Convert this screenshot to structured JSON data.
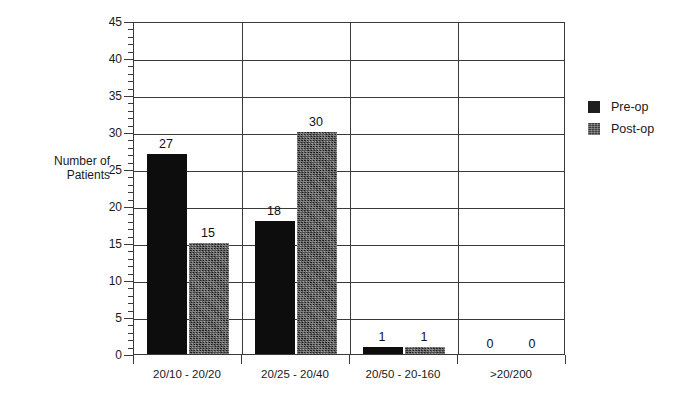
{
  "chart_data": {
    "type": "bar",
    "title": "",
    "xlabel": "",
    "ylabel": "Number of Patients",
    "ylabel_lines": [
      "Number of",
      "Patients"
    ],
    "ylim": [
      0,
      45
    ],
    "ytick_step": 5,
    "yminor_step": 1,
    "grid": "horizontal-and-category-separators",
    "legend_position": "right",
    "categories": [
      "20/10 - 20/20",
      "20/25 - 20/40",
      "20/50 - 20-160",
      ">20/200"
    ],
    "ytick_labels": [
      "0",
      "5",
      "10",
      "15",
      "20",
      "25",
      "30",
      "35",
      "40",
      "45"
    ],
    "series": [
      {
        "name": "Pre-op",
        "color": "#0d0d0d",
        "values": [
          27,
          18,
          1,
          0
        ]
      },
      {
        "name": "Post-op",
        "color": "#3b3b3b",
        "values": [
          15,
          30,
          1,
          0
        ]
      }
    ],
    "data_labels": [
      [
        "27",
        "15"
      ],
      [
        "18",
        "30"
      ],
      [
        "1",
        "1"
      ],
      [
        "0",
        "0"
      ]
    ]
  },
  "legend": {
    "items": [
      {
        "label": "Pre-op",
        "swatch": "pre-op-swatch"
      },
      {
        "label": "Post-op",
        "swatch": "post-op-swatch"
      }
    ]
  }
}
